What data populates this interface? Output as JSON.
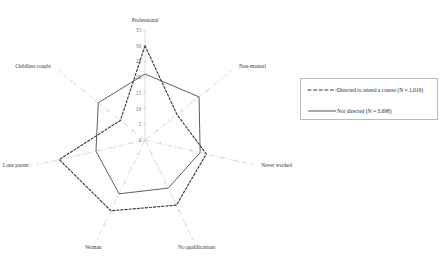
{
  "chart_data": {
    "type": "radar",
    "title": "",
    "categories": [
      "Professional",
      "Non-manual",
      "Never worked",
      "No qualifications",
      "Woman",
      "Lone parent",
      "Childless couple"
    ],
    "rlim": [
      0,
      35
    ],
    "rticks": [
      0,
      5,
      10,
      15,
      20,
      25,
      30,
      35
    ],
    "grid": false,
    "legend_position": "right",
    "series": [
      {
        "name": "Directed to attend a course (N = 1,019)",
        "style": "dashed",
        "color": "#3a3a3a",
        "values": [
          30,
          13,
          20,
          23,
          25,
          28,
          10
        ]
      },
      {
        "name": "Not directed (N = 3,698)",
        "style": "solid",
        "color": "#555555",
        "values": [
          21,
          22,
          18,
          17,
          19,
          16,
          19
        ]
      }
    ]
  },
  "axis": {
    "tick_labels": [
      "0",
      "5",
      "10",
      "15",
      "20",
      "25",
      "30",
      "35"
    ],
    "category_labels": {
      "professional": "Professional",
      "non_manual": "Non-manual",
      "never_worked": "Never worked",
      "no_qualifications": "No qualifications",
      "woman": "Woman",
      "lone_parent": "Lone parent",
      "childless_couple": "Childless couple"
    }
  },
  "legend": {
    "items": [
      {
        "label": "Directed to attend a course (N = 1,019)",
        "style": "dashed"
      },
      {
        "label": "Not directed (N = 3,698)",
        "style": "solid"
      }
    ]
  }
}
